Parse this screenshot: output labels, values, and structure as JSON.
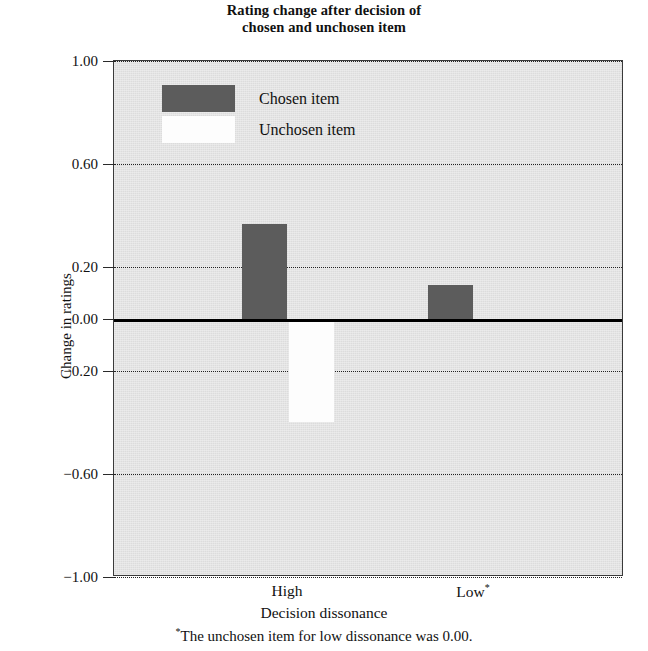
{
  "chart_data": {
    "type": "bar",
    "title": "Rating change after decision of chosen and unchosen item",
    "title_line1": "Rating change after decision of",
    "title_line2": "chosen and unchosen item",
    "xlabel": "Decision dissonance",
    "ylabel": "Change in ratings",
    "categories": [
      "High",
      "Low"
    ],
    "category_labels": [
      "High",
      "Low*"
    ],
    "series": [
      {
        "name": "Chosen item",
        "color": "#5c5c5c",
        "values": [
          0.37,
          0.13
        ]
      },
      {
        "name": "Unchosen item",
        "color": "#fdfdfd",
        "values": [
          -0.4,
          0.0
        ]
      }
    ],
    "ylim": [
      -1.0,
      1.0
    ],
    "ytick_labels": [
      "1.00",
      "0.60",
      "0.20",
      "0.00",
      "−0.20",
      "−0.60",
      "−1.00"
    ],
    "ytick_values": [
      1.0,
      0.6,
      0.2,
      0.0,
      -0.2,
      -0.6,
      -1.0
    ],
    "grid": true,
    "grid_style": "dotted-horizontal",
    "legend_position": "top-left-inside",
    "plot_background": "#dcdcdc",
    "footnote": "The unchosen item for low dissonance was 0.00.",
    "footnote_marker": "*"
  },
  "legend": {
    "entries": [
      {
        "label": "Chosen item",
        "color": "#5c5c5c"
      },
      {
        "label": "Unchosen item",
        "color": "#fdfdfd"
      }
    ]
  },
  "axis": {
    "y_title": "Change in ratings",
    "x_title": "Decision dissonance",
    "ticks": [
      {
        "label": "1.00",
        "value": 1.0
      },
      {
        "label": "0.60",
        "value": 0.6
      },
      {
        "label": "0.20",
        "value": 0.2
      },
      {
        "label": "0.00",
        "value": 0.0
      },
      {
        "label": "−0.20",
        "value": -0.2
      },
      {
        "label": "−0.60",
        "value": -0.6
      },
      {
        "label": "−1.00",
        "value": -1.0
      }
    ]
  },
  "x_labels": [
    {
      "text": "High",
      "marker": ""
    },
    {
      "text": "Low",
      "marker": "*"
    }
  ],
  "footnote": {
    "marker": "*",
    "text": "The unchosen item for low dissonance was 0.00."
  }
}
